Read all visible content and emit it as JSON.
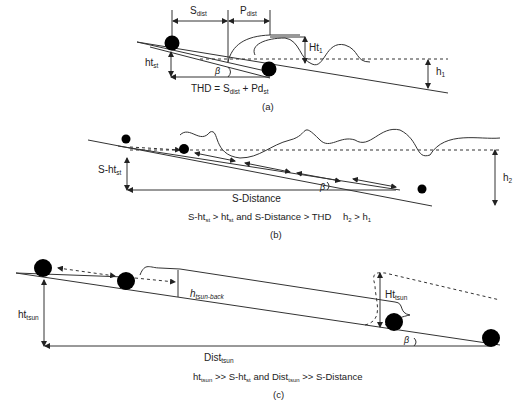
{
  "panel_a": {
    "caption": "(a)",
    "labels": {
      "s_dist": {
        "base": "S",
        "sub": "dist"
      },
      "p_dist": {
        "base": "P",
        "sub": "dist"
      },
      "ht1": {
        "base": "Ht",
        "sub": "1"
      },
      "ht_st": {
        "base": "ht",
        "sub": "st"
      },
      "beta": "β",
      "h1": {
        "base": "h",
        "sub": "1"
      }
    },
    "equation": {
      "prefix": "THD = S",
      "sub1": "dist",
      "mid": " + Pd",
      "sub2": "st"
    }
  },
  "panel_b": {
    "caption": "(b)",
    "labels": {
      "s_ht_st": {
        "base": "S-ht",
        "sub": "st"
      },
      "s_distance": "S-Distance",
      "beta": "β",
      "h2": {
        "base": "h",
        "sub": "2"
      }
    },
    "condition": {
      "p1": "S-ht",
      "s1": "st",
      "p2": " > ht",
      "s2": "st",
      "p3": " and S-Distance > THD"
    },
    "h_relation": {
      "p1": "h",
      "s1": "2",
      "p2": " > h",
      "s2": "1"
    }
  },
  "panel_c": {
    "caption": "(c)",
    "labels": {
      "h_tsun_back": {
        "base": "h",
        "sub": "tsun-back"
      },
      "ht_tsun": {
        "base": "ht",
        "sub": "tsun"
      },
      "Ht_tsun": {
        "base": "Ht",
        "sub": "tsun"
      },
      "dist_tsun": {
        "base": "Dist",
        "sub": "tsun"
      },
      "beta": "β"
    },
    "condition": {
      "p1": "ht",
      "s1": "tsun",
      "p2": " >> S-ht",
      "s2": "st",
      "p3": " and Dist",
      "s3": "tsun",
      "p4": " >> S-Distance"
    }
  }
}
